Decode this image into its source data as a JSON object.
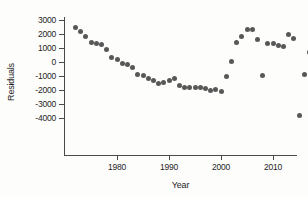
{
  "chart_data": {
    "type": "scatter",
    "title": "",
    "xlabel": "Year",
    "ylabel": "Residuals",
    "xlim": [
      1971,
      2013
    ],
    "ylim": [
      -4500,
      3200
    ],
    "xticks": [
      1980,
      1990,
      2000,
      2010
    ],
    "xticklabels": [
      "1980",
      "1990",
      "2000",
      "2010"
    ],
    "yticks": [
      3000,
      2000,
      1000,
      0,
      -1000,
      -2000,
      -3000,
      -4000
    ],
    "yticklabels": [
      "3000",
      "2000",
      "1000",
      "0",
      "-1000",
      "-2000",
      "-3000",
      "-4000"
    ],
    "grid": false,
    "legend": null,
    "marker": {
      "shape": "circle",
      "color": "#585858",
      "size": 5
    },
    "points": [
      {
        "x": 1972,
        "y": 2500
      },
      {
        "x": 1973,
        "y": 2200
      },
      {
        "x": 1974,
        "y": 1850
      },
      {
        "x": 1975,
        "y": 1400
      },
      {
        "x": 1976,
        "y": 1350
      },
      {
        "x": 1977,
        "y": 1250
      },
      {
        "x": 1978,
        "y": 900
      },
      {
        "x": 1979,
        "y": 350
      },
      {
        "x": 1980,
        "y": 150
      },
      {
        "x": 1981,
        "y": -100
      },
      {
        "x": 1982,
        "y": -200
      },
      {
        "x": 1983,
        "y": -400
      },
      {
        "x": 1984,
        "y": -900
      },
      {
        "x": 1985,
        "y": -950
      },
      {
        "x": 1986,
        "y": -1200
      },
      {
        "x": 1987,
        "y": -1300
      },
      {
        "x": 1988,
        "y": -1500
      },
      {
        "x": 1989,
        "y": -1450
      },
      {
        "x": 1990,
        "y": -1350
      },
      {
        "x": 1991,
        "y": -1200
      },
      {
        "x": 1992,
        "y": -1700
      },
      {
        "x": 1993,
        "y": -1850
      },
      {
        "x": 1994,
        "y": -1800
      },
      {
        "x": 1995,
        "y": -1800
      },
      {
        "x": 1996,
        "y": -1850
      },
      {
        "x": 1997,
        "y": -1900
      },
      {
        "x": 1998,
        "y": -2050
      },
      {
        "x": 1999,
        "y": -1950
      },
      {
        "x": 2000,
        "y": -2100
      },
      {
        "x": 2001,
        "y": -1000
      },
      {
        "x": 2002,
        "y": 50
      },
      {
        "x": 2003,
        "y": 1400
      },
      {
        "x": 2004,
        "y": 1850
      },
      {
        "x": 2005,
        "y": 2300
      },
      {
        "x": 2006,
        "y": 2300
      },
      {
        "x": 2007,
        "y": 1600
      },
      {
        "x": 2008,
        "y": -950
      },
      {
        "x": 2009,
        "y": 1350
      },
      {
        "x": 2010,
        "y": 1300
      },
      {
        "x": 2011,
        "y": 1200
      },
      {
        "x": 2012,
        "y": 1100
      },
      {
        "x": 2013,
        "y": 2000
      },
      {
        "x": 2014,
        "y": 1700
      },
      {
        "x": 2015,
        "y": -3800
      },
      {
        "x": 2016,
        "y": -900
      },
      {
        "x": 2017,
        "y": 700
      },
      {
        "x": 2018,
        "y": 950
      }
    ]
  }
}
